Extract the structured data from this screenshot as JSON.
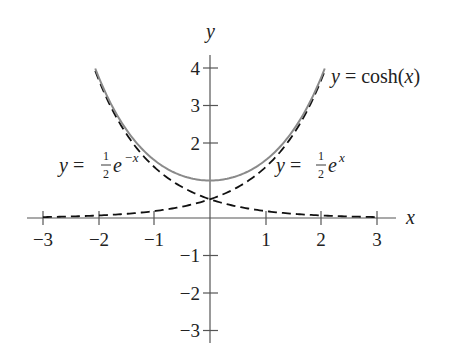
{
  "chart_data": {
    "type": "line",
    "title": "",
    "xlabel": "x",
    "ylabel": "y",
    "xlim": [
      -3,
      3
    ],
    "ylim": [
      -3,
      4
    ],
    "grid": false,
    "x_ticks": [
      -3,
      -2,
      -1,
      1,
      2,
      3
    ],
    "y_ticks": [
      -3,
      -2,
      -1,
      1,
      2,
      3,
      4
    ],
    "series": [
      {
        "name": "y = cosh(x)",
        "style": "solid",
        "color": "#8a8a8a",
        "domain": [
          -2.06,
          2.06
        ],
        "x": [
          -2,
          -1.5,
          -1,
          -0.5,
          0,
          0.5,
          1,
          1.5,
          2
        ],
        "y": [
          3.76,
          2.35,
          1.54,
          1.13,
          1.0,
          1.13,
          1.54,
          2.35,
          3.76
        ]
      },
      {
        "name": "y = ½e^x",
        "style": "dashed",
        "color": "#111111",
        "domain": [
          -3,
          2.06
        ],
        "x": [
          -3,
          -2,
          -1,
          0,
          1,
          2
        ],
        "y": [
          0.025,
          0.068,
          0.184,
          0.5,
          1.36,
          3.69
        ]
      },
      {
        "name": "y = ½e^(−x)",
        "style": "dashed",
        "color": "#111111",
        "domain": [
          -2.06,
          3
        ],
        "x": [
          -2,
          -1,
          0,
          1,
          2,
          3
        ],
        "y": [
          3.69,
          1.36,
          0.5,
          0.184,
          0.068,
          0.025
        ]
      }
    ],
    "annotations": [
      {
        "text_prefix": "y = cosh(",
        "var": "x",
        "text_suffix": ")",
        "near": "right end of cosh curve"
      },
      {
        "text_prefix": "y = ",
        "frac_num": "1",
        "frac_den": "2",
        "base": "e",
        "exponent": "x",
        "near": "right dashed curve"
      },
      {
        "text_prefix": "y = ",
        "frac_num": "1",
        "frac_den": "2",
        "base": "e",
        "exponent": "−x",
        "near": "left dashed curve"
      }
    ]
  },
  "labels": {
    "x_axis": "x",
    "y_axis": "y",
    "x_ticks": [
      "−3",
      "−2",
      "−1",
      "1",
      "2",
      "3"
    ],
    "y_ticks": [
      "4",
      "3",
      "2",
      "−1",
      "−2",
      "−3"
    ],
    "cosh": {
      "y": "y",
      "eq": " = cosh(",
      "x": "x",
      "close": ")"
    },
    "exp_pos": {
      "y": "y",
      "eq": " = ",
      "num": "1",
      "den": "2",
      "base": "e",
      "exp": "x"
    },
    "exp_neg": {
      "y": "y",
      "eq": " = ",
      "num": "1",
      "den": "2",
      "base": "e",
      "exp": "−x"
    }
  }
}
